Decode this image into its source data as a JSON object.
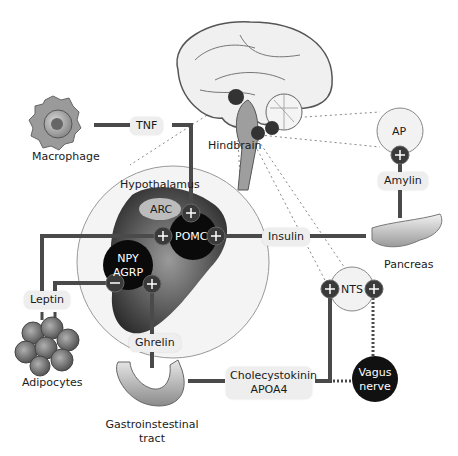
{
  "colors": {
    "line": "#4a4a4a",
    "node_dark": "#111111",
    "sign_node": "#3a3a3a",
    "hypothalamus_bg": "#f4f4f4",
    "pill_bg": "#eeeeee",
    "dotted": "#888888"
  },
  "labels": {
    "macrophage": "Macrophage",
    "tnf": "TNF",
    "hindbrain": "Hindbrain",
    "hypothalamus": "Hypothalamus",
    "arc": "ARC",
    "pomc": "POMC",
    "npy": "NPY",
    "agrp": "AGRP",
    "insulin": "Insulin",
    "pancreas": "Pancreas",
    "ap": "AP",
    "amylin": "Amylin",
    "nts": "NTS",
    "leptin": "Leptin",
    "adipocytes": "Adipocytes",
    "ghrelin": "Ghrelin",
    "gi_line1": "Gastroinstestinal",
    "gi_line2": "tract",
    "cck_line1": "Cholecystokinin",
    "cck_line2": "APOA4",
    "vagus_line1": "Vagus",
    "vagus_line2": "nerve"
  },
  "signs": {
    "plus": "+",
    "minus": "−"
  }
}
